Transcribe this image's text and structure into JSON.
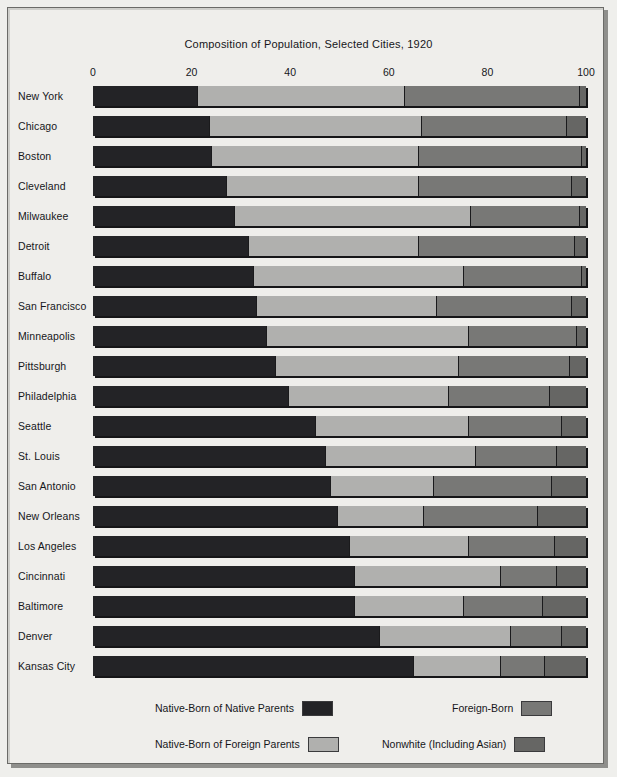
{
  "chart_data": {
    "type": "bar",
    "orientation": "horizontal",
    "stacked": true,
    "normalized_percent": true,
    "title": "Composition of Population, Selected Cities, 1920",
    "xlabel": "",
    "ylabel": "",
    "xlim": [
      0,
      100
    ],
    "xticks": [
      0,
      20,
      40,
      60,
      80,
      100
    ],
    "xticklabels": [
      "0",
      "20",
      "40",
      "60",
      "80",
      "100"
    ],
    "grid": false,
    "legend_position": "bottom",
    "categories": [
      "New York",
      "Chicago",
      "Boston",
      "Cleveland",
      "Milwaukee",
      "Detroit",
      "Buffalo",
      "San Francisco",
      "Minneapolis",
      "Pittsburgh",
      "Philadelphia",
      "Seattle",
      "St. Louis",
      "San Antonio",
      "New Orleans",
      "Los Angeles",
      "Cincinnati",
      "Baltimore",
      "Denver",
      "Kansas City"
    ],
    "series": [
      {
        "name": "Native-Born of Native Parents",
        "color": "#232326",
        "values": [
          21.0,
          23.5,
          24.0,
          27.0,
          28.5,
          31.5,
          32.5,
          33.0,
          35.0,
          37.0,
          39.5,
          45.0,
          47.0,
          48.0,
          49.5,
          52.0,
          53.0,
          53.0,
          58.0,
          65.0
        ]
      },
      {
        "name": "Native-Born of Foreign Parents",
        "color": "#b0b0ae",
        "values": [
          42.0,
          43.0,
          42.0,
          39.0,
          48.0,
          34.5,
          42.5,
          36.5,
          41.0,
          37.0,
          32.5,
          31.0,
          30.5,
          21.0,
          17.5,
          24.0,
          29.5,
          22.0,
          26.5,
          17.5
        ]
      },
      {
        "name": "Foreign-Born",
        "color": "#787876",
        "values": [
          35.5,
          29.5,
          33.0,
          31.0,
          22.0,
          31.5,
          24.0,
          27.5,
          22.0,
          22.5,
          20.5,
          19.0,
          16.5,
          24.0,
          23.0,
          17.5,
          11.5,
          16.0,
          10.5,
          9.0
        ]
      },
      {
        "name": "Nonwhite (Including Asian)",
        "color": "#666664",
        "values": [
          1.5,
          4.0,
          1.0,
          3.0,
          1.5,
          2.5,
          1.0,
          3.0,
          2.0,
          3.5,
          7.5,
          5.0,
          6.0,
          7.0,
          10.0,
          6.5,
          6.0,
          9.0,
          5.0,
          8.5
        ]
      }
    ]
  },
  "legend": {
    "items": [
      {
        "label": "Native-Born of Native Parents",
        "color": "#232326"
      },
      {
        "label": "Native-Born of Foreign Parents",
        "color": "#b0b0ae"
      },
      {
        "label": "Foreign-Born",
        "color": "#787876"
      },
      {
        "label": "Nonwhite (Including Asian)",
        "color": "#666664"
      }
    ]
  }
}
